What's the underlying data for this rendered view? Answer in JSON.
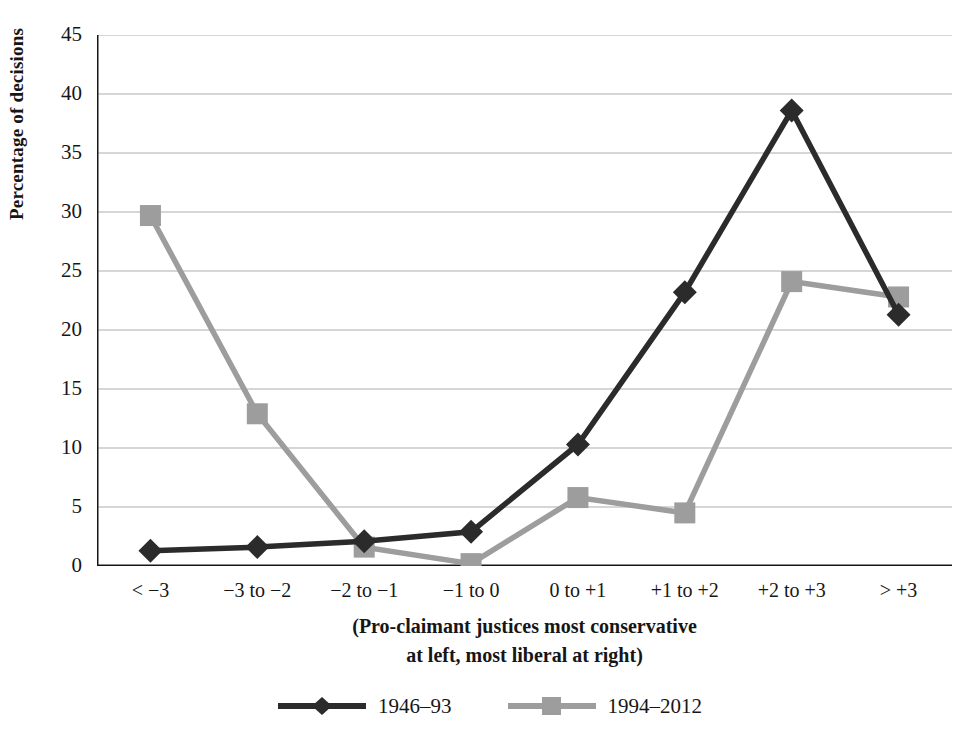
{
  "chart_data": {
    "type": "line",
    "title": "",
    "xlabel": "(Pro-claimant justices most conservative at left, most liberal at right)",
    "ylabel": "Percentage of decisions",
    "categories": [
      "< −3",
      "−3 to −2",
      "−2 to −1",
      "−1 to 0",
      "0 to +1",
      "+1 to +2",
      "+2 to +3",
      "> +3"
    ],
    "ylim": [
      0,
      45
    ],
    "yticks": [
      0,
      5,
      10,
      15,
      20,
      25,
      30,
      35,
      40,
      45
    ],
    "grid": "horizontal",
    "legend_position": "bottom-center",
    "series": [
      {
        "name": "1946–93",
        "color": "#2b2b2b",
        "marker": "diamond",
        "values": [
          1.3,
          1.6,
          2.1,
          2.9,
          10.3,
          23.2,
          38.6,
          21.3
        ]
      },
      {
        "name": "1994–2012",
        "color": "#9d9d9d",
        "marker": "square",
        "values": [
          29.7,
          12.9,
          1.6,
          0.2,
          5.8,
          4.5,
          24.1,
          22.8
        ]
      }
    ]
  },
  "axis": {
    "y_title": "Percentage of decisions",
    "y_tick_labels": [
      "45",
      "40",
      "35",
      "30",
      "25",
      "20",
      "15",
      "10",
      "5",
      "0"
    ],
    "x_caption_line1": "(Pro-claimant justices most conservative",
    "x_caption_line2": "at left, most liberal at right)"
  },
  "legend": {
    "items": [
      {
        "label": "1946–93",
        "color": "#2b2b2b",
        "marker": "diamond-marker-icon"
      },
      {
        "label": "1994–2012",
        "color": "#9d9d9d",
        "marker": "square-marker-icon"
      }
    ]
  },
  "style": {
    "axis_color": "#161616",
    "grid_color": "#c9c9c9",
    "background": "#ffffff"
  }
}
